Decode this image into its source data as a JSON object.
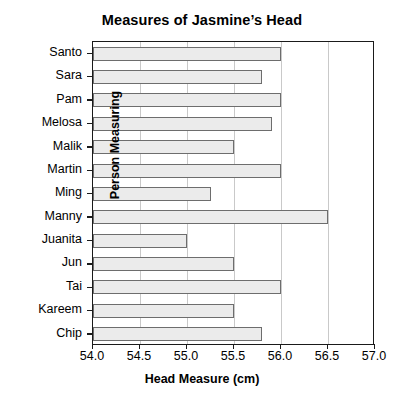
{
  "chart_data": {
    "type": "bar",
    "orientation": "horizontal",
    "title": "Measures of Jasmine’s Head",
    "xlabel": "Head Measure (cm)",
    "ylabel": "Person Measuring",
    "categories": [
      "Santo",
      "Sara",
      "Pam",
      "Melosa",
      "Malik",
      "Martin",
      "Ming",
      "Manny",
      "Juanita",
      "Jun",
      "Tai",
      "Kareem",
      "Chip"
    ],
    "values": [
      56.0,
      55.8,
      56.0,
      55.9,
      55.5,
      56.0,
      55.25,
      56.5,
      55.0,
      55.5,
      56.0,
      55.5,
      55.8
    ],
    "xlim": [
      54.0,
      57.0
    ],
    "xticks": [
      "54.0",
      "54.5",
      "55.0",
      "55.5",
      "56.0",
      "56.5",
      "57.0"
    ],
    "xtick_values": [
      54.0,
      54.5,
      55.0,
      55.5,
      56.0,
      56.5,
      57.0
    ],
    "grid": "vertical",
    "legend": "none",
    "bar_fill": "#ebebeb",
    "bar_edge": "#6d6d6d",
    "grid_color": "#c9c9c9",
    "axis_color": "#1a1a1a"
  }
}
